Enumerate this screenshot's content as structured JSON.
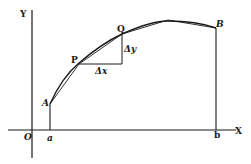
{
  "diagram": {
    "colors": {
      "ink": "#1a1a1a",
      "background": "#ffffff"
    },
    "axes": {
      "y_label": "Y",
      "x_label": "X",
      "origin_label": "O"
    },
    "points": {
      "A": "A",
      "P": "P",
      "Q": "Q",
      "B": "B"
    },
    "ticks": {
      "a": "a",
      "b": "b"
    },
    "increments": {
      "dx": "Δx",
      "dy": "Δy"
    }
  }
}
